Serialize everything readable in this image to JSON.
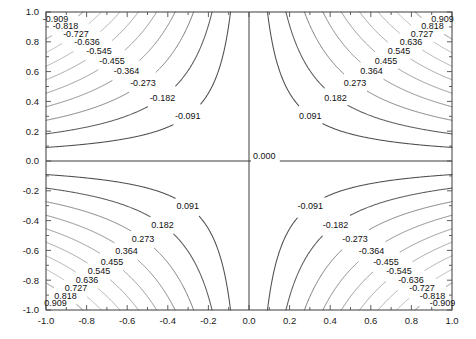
{
  "chart_data": {
    "type": "contour",
    "title": "",
    "subtitle": "",
    "xlabel": "",
    "ylabel": "",
    "function": "z = x * y",
    "xlim": [
      -1.0,
      1.0
    ],
    "ylim": [
      -1.0,
      1.0
    ],
    "grid": false,
    "legend": "none",
    "x_ticks": [
      "-1.0",
      "-0.8",
      "-0.6",
      "-0.4",
      "-0.2",
      "0.0",
      "0.2",
      "0.4",
      "0.6",
      "0.8",
      "1.0"
    ],
    "x_tick_values": [
      -1.0,
      -0.8,
      -0.6,
      -0.4,
      -0.2,
      0.0,
      0.2,
      0.4,
      0.6,
      0.8,
      1.0
    ],
    "y_ticks": [
      "-1.0",
      "-0.8",
      "-0.6",
      "-0.4",
      "-0.2",
      "0.0",
      "0.2",
      "0.4",
      "0.6",
      "0.8",
      "1.0"
    ],
    "y_tick_values": [
      -1.0,
      -0.8,
      -0.6,
      -0.4,
      -0.2,
      0.0,
      0.2,
      0.4,
      0.6,
      0.8,
      1.0
    ],
    "minor_tick_step": 0.1,
    "level_step": 0.0909090909,
    "levels": [
      -0.909,
      -0.818,
      -0.727,
      -0.636,
      -0.545,
      -0.455,
      -0.364,
      -0.273,
      -0.182,
      -0.091,
      0.0,
      0.091,
      0.182,
      0.273,
      0.364,
      0.455,
      0.545,
      0.636,
      0.727,
      0.818,
      0.909
    ],
    "level_labels": [
      "-0.909",
      "-0.818",
      "-0.727",
      "-0.636",
      "-0.545",
      "-0.455",
      "-0.364",
      "-0.273",
      "-0.182",
      "-0.091",
      "0.000",
      "0.091",
      "0.182",
      "0.273",
      "0.364",
      "0.455",
      "0.545",
      "0.636",
      "0.727",
      "0.818",
      "0.909"
    ],
    "zero_contour_label": "0.000",
    "quadrant_sign": {
      "upper_left": "negative",
      "upper_right": "positive",
      "lower_left": "positive",
      "lower_right": "negative"
    },
    "colors": {
      "frame": "#4d4d4d",
      "axis_text": "#1a1a1a",
      "label_text": "#111111",
      "contour_dark": "#3c3c3c",
      "contour_light": "#c8c8c8",
      "background": "#ffffff"
    }
  }
}
